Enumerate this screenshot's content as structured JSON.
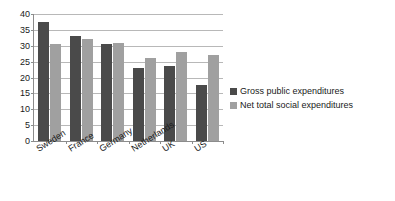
{
  "chart_data": {
    "type": "bar",
    "title": "",
    "subtitle": "",
    "xlabel": "",
    "ylabel": "",
    "categories": [
      "Sweden",
      "France",
      "Germany",
      "Netherlands",
      "UK",
      "US"
    ],
    "series": [
      {
        "name": "Gross public expenditures",
        "color": "#4a4a4a",
        "values": [
          37.5,
          33.0,
          30.5,
          23.0,
          23.5,
          17.5
        ]
      },
      {
        "name": "Net total social expenditures",
        "color": "#a0a0a0",
        "values": [
          30.5,
          32.0,
          31.0,
          26.0,
          28.0,
          27.0
        ]
      }
    ],
    "ylim": [
      0,
      40
    ],
    "yticks": [
      0,
      5,
      10,
      15,
      20,
      25,
      30,
      35,
      40
    ],
    "ytick_labels": [
      "0",
      "5",
      "10",
      "15",
      "20",
      "25",
      "30",
      "35",
      "40"
    ],
    "grid": true,
    "grid_axis": "y",
    "legend_position": "right",
    "legend": [
      "Gross public expenditures",
      "Net total social expenditures"
    ],
    "annotations": []
  },
  "colors": {
    "series_dark": "#4a4a4a",
    "series_light": "#a0a0a0",
    "gridline": "#b8b8b8",
    "axis": "#8c8c8c",
    "text": "#1a1a1a",
    "background": "#ffffff"
  }
}
